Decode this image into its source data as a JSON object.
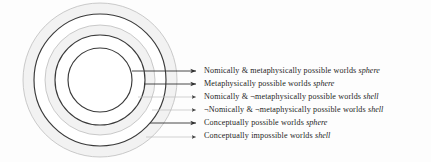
{
  "figure": {
    "type": "concentric-modal-spheres-diagram",
    "background_color": "#fdfdfd",
    "center": {
      "x": 100,
      "y": 80
    },
    "dark_stroke": "#3a3a3a",
    "faint_stroke": "#b9b9b9",
    "shell_fill": "#f2f2f2"
  },
  "circles": [
    {
      "name": "conceptually-impossible-worlds-outer-boundary",
      "radius": 77,
      "style": "faint"
    },
    {
      "name": "conceptually-possible-worlds-sphere",
      "radius": 66,
      "style": "dark"
    },
    {
      "name": "not-nomically-not-metaphysically-shell-boundary",
      "radius": 55,
      "style": "faint"
    },
    {
      "name": "metaphysically-possible-worlds-sphere",
      "radius": 45,
      "style": "dark"
    },
    {
      "name": "nomically-and-metaphysically-possible-worlds-sphere",
      "radius": 32,
      "style": "dark"
    }
  ],
  "legend": {
    "arrow_x": 198,
    "items": [
      {
        "id": "nomically-and-metaphysically-possible-worlds-sphere",
        "text_prefix": "Nomically & metaphysically possible worlds ",
        "kind": "sphere",
        "negations": [],
        "y": 71,
        "leader": {
          "from_x": 132,
          "from_y": 71,
          "elbow_x": 162,
          "to_x": 196,
          "to_y": 71
        },
        "line_style": "dark"
      },
      {
        "id": "metaphysically-possible-worlds-sphere",
        "text_prefix": "Metaphysically possible worlds ",
        "kind": "sphere",
        "negations": [],
        "y": 84,
        "leader": {
          "from_x": 144,
          "from_y": 84,
          "elbow_x": 162,
          "to_x": 196,
          "to_y": 84
        },
        "line_style": "dark"
      },
      {
        "id": "nomically-and-not-metaphysically-possible-worlds-shell",
        "text_prefix": "Nomically & ¬metaphysically possible worlds ",
        "kind": "shell",
        "negations": [
          "metaphysically"
        ],
        "y": 97,
        "leader": {
          "from_x": 138,
          "from_y": 97,
          "elbow_x": 168,
          "to_x": 196,
          "to_y": 97
        },
        "line_style": "faint"
      },
      {
        "id": "not-nomically-and-not-metaphysically-possible-worlds-shell",
        "text_prefix": "¬Nomically & ¬metaphysically possible worlds ",
        "kind": "shell",
        "negations": [
          "Nomically",
          "metaphysically"
        ],
        "y": 110,
        "leader": {
          "from_x": 152,
          "from_y": 110,
          "elbow_x": 174,
          "to_x": 196,
          "to_y": 110
        },
        "line_style": "faint"
      },
      {
        "id": "conceptually-possible-worlds-sphere",
        "text_prefix": "Conceptually possible worlds ",
        "kind": "sphere",
        "negations": [],
        "y": 123,
        "leader": {
          "from_x": 150,
          "from_y": 123,
          "elbow_x": 166,
          "to_x": 196,
          "to_y": 123
        },
        "line_style": "dark"
      },
      {
        "id": "conceptually-impossible-worlds-shell",
        "text_prefix": "Conceptually impossible worlds ",
        "kind": "shell",
        "negations": [],
        "y": 137,
        "leader": {
          "from_x": 146,
          "from_y": 137,
          "elbow_x": 166,
          "to_x": 196,
          "to_y": 137
        },
        "line_style": "faint"
      }
    ]
  }
}
